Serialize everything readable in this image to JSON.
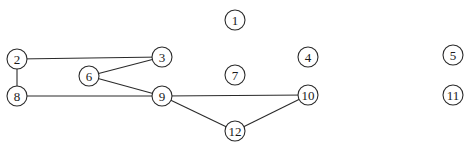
{
  "diagram": {
    "type": "undirected-graph",
    "node_radius": 10,
    "nodes": [
      {
        "id": "1",
        "label": "1",
        "x": 235,
        "y": 20
      },
      {
        "id": "2",
        "label": "2",
        "x": 17,
        "y": 59
      },
      {
        "id": "3",
        "label": "3",
        "x": 162,
        "y": 57
      },
      {
        "id": "4",
        "label": "4",
        "x": 308,
        "y": 57
      },
      {
        "id": "5",
        "label": "5",
        "x": 453,
        "y": 55
      },
      {
        "id": "6",
        "label": "6",
        "x": 89,
        "y": 76
      },
      {
        "id": "7",
        "label": "7",
        "x": 235,
        "y": 75
      },
      {
        "id": "8",
        "label": "8",
        "x": 17,
        "y": 96
      },
      {
        "id": "9",
        "label": "9",
        "x": 162,
        "y": 96
      },
      {
        "id": "10",
        "label": "10",
        "x": 308,
        "y": 95
      },
      {
        "id": "11",
        "label": "11",
        "x": 453,
        "y": 95
      },
      {
        "id": "12",
        "label": "12",
        "x": 235,
        "y": 131
      }
    ],
    "edges": [
      {
        "from": "2",
        "to": "3"
      },
      {
        "from": "2",
        "to": "8"
      },
      {
        "from": "8",
        "to": "9"
      },
      {
        "from": "6",
        "to": "3"
      },
      {
        "from": "6",
        "to": "9"
      },
      {
        "from": "9",
        "to": "10"
      },
      {
        "from": "9",
        "to": "12"
      },
      {
        "from": "12",
        "to": "10"
      }
    ],
    "colors": {
      "stroke": "#2a2a2a",
      "background": "#ffffff",
      "text": "#1a1a1a"
    }
  }
}
